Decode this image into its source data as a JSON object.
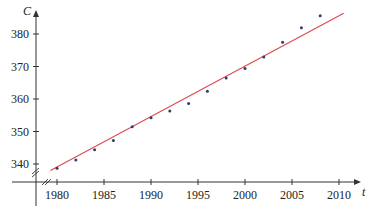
{
  "chart_data": {
    "type": "scatter",
    "title": "",
    "xlabel": "t",
    "ylabel": "C",
    "xlim": [
      1977,
      2012
    ],
    "ylim": [
      335,
      386
    ],
    "grid": false,
    "legend": null,
    "x_ticks": [
      1980,
      1985,
      1990,
      1995,
      2000,
      2005,
      2010
    ],
    "y_ticks": [
      340,
      350,
      360,
      370,
      380
    ],
    "axis_breaks": [
      "x-axis break near origin (//)",
      "y-axis break near origin (//)"
    ],
    "series": [
      {
        "name": "data points",
        "kind": "scatter",
        "color": "#2c3e6b",
        "x": [
          1980,
          1982,
          1984,
          1986,
          1988,
          1990,
          1992,
          1994,
          1996,
          1998,
          2000,
          2002,
          2004,
          2006,
          2008
        ],
        "y": [
          338.7,
          341.2,
          344.4,
          347.2,
          351.5,
          354.2,
          356.3,
          358.6,
          362.4,
          366.5,
          369.4,
          372.9,
          377.5,
          381.9,
          385.6
        ]
      },
      {
        "name": "linear model",
        "kind": "line",
        "color": "#e0484e",
        "x": [
          1979.3,
          2010.5
        ],
        "y": [
          338.0,
          386.4
        ]
      }
    ]
  },
  "axes": {
    "x_title": "t",
    "y_title": "C",
    "x_tick_labels": [
      "1980",
      "1985",
      "1990",
      "1995",
      "2000",
      "2005",
      "2010"
    ],
    "y_tick_labels": [
      "340",
      "350",
      "360",
      "370",
      "380"
    ]
  }
}
